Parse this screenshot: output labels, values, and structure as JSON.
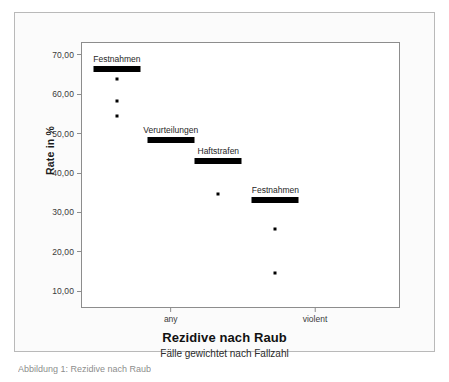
{
  "figure": {
    "bottom_caption": "Abbildung 1: Rezidive nach Raub"
  },
  "chart_data": {
    "type": "scatter",
    "title": "Rezidive nach Raub",
    "subtitle": "Fälle gewichtet nach Fallzahl",
    "xlabel": "Rezidive nach Raub",
    "ylabel": "Rate in %",
    "ylim": [
      6,
      73
    ],
    "xlim": [
      0,
      2
    ],
    "grid": false,
    "legend_position": "inline-labels",
    "y_ticks": [
      "70,00",
      "60,00",
      "50,00",
      "40,00",
      "30,00",
      "20,00",
      "10,00"
    ],
    "y_tick_values": [
      70,
      60,
      50,
      40,
      30,
      20,
      10
    ],
    "x_ticks": [
      "any",
      "violent"
    ],
    "x_tick_values": [
      0.56,
      1.47
    ],
    "series": [
      {
        "name": "Festnahmen",
        "label": "Festnahmen",
        "mean_marker": 66.5,
        "x": 0.22,
        "values": [
          63.9,
          58.2,
          54.6
        ],
        "label_offset_x": 0.0
      },
      {
        "name": "Verurteilungen",
        "label": "Verurteilungen",
        "mean_marker": 48.5,
        "x": 0.56,
        "values": [],
        "label_offset_x": 0.0
      },
      {
        "name": "Haftstrafen",
        "label": "Haftstrafen",
        "mean_marker": 43.1,
        "x": 0.86,
        "values": [
          34.8
        ],
        "label_offset_x": 0.0
      },
      {
        "name": "Festnahmen-violent",
        "label": "Festnahmen",
        "mean_marker": 33.1,
        "x": 1.22,
        "values": [
          25.8,
          14.7
        ],
        "label_offset_x": 0.0
      }
    ],
    "colors": {
      "marker": "#000000",
      "axis": "#8d8d8d",
      "text": "#262626",
      "plot_background": "#ffffff",
      "figure_background": "#fbfbfb",
      "figure_border": "#b9b9b9"
    }
  }
}
